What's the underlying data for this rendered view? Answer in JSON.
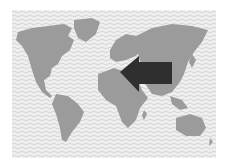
{
  "figure": {
    "type": "world-map-illustration",
    "colors": {
      "background": "#ffffff",
      "ocean": "#efefef",
      "ocean_wave": "#cfcfcf",
      "land": "#9b9b9b",
      "arrow": "#2f2f2f"
    },
    "arrow": {
      "direction": "west",
      "from_region": "asia",
      "to_region": "mediterranean-middle-east"
    }
  }
}
